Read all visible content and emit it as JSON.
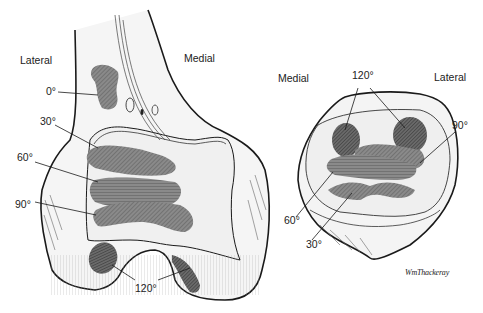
{
  "femur_view": {
    "labels": {
      "lateral": "Lateral",
      "medial": "Medial"
    },
    "angles": {
      "a0": "0°",
      "a30": "30°",
      "a60": "60°",
      "a90": "90°",
      "a120": "120°"
    }
  },
  "patella_view": {
    "labels": {
      "medial": "Medial",
      "lateral": "Lateral"
    },
    "angles": {
      "a120": "120°",
      "a90": "90°",
      "a60": "60°",
      "a30": "30°"
    }
  },
  "signature": "WmThackeray",
  "colors": {
    "outline": "#1a1a1a",
    "bone_fill": "#f4f4f4",
    "contact_area": "#7a7a7a",
    "contact_dark": "#4e4e4e",
    "text": "#222222"
  }
}
